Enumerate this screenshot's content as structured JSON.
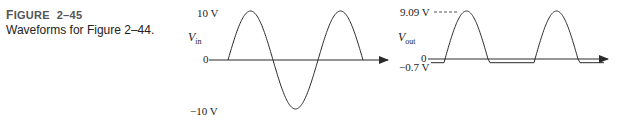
{
  "caption": {
    "figure_label_first": "F",
    "figure_label_rest": "IGURE",
    "figure_number": "2–45",
    "description": "Waveforms for Figure 2–44."
  },
  "input_plot": {
    "signal_symbol": "V",
    "signal_subscript": "in",
    "labels": {
      "positive_peak": "10 V",
      "zero": "0",
      "negative_peak": "−10 V"
    },
    "positive_peak_volts": 10,
    "negative_peak_volts": -10,
    "waveform": "sine",
    "cycles_shown": 1.5
  },
  "output_plot": {
    "signal_symbol": "V",
    "signal_subscript": "out",
    "labels": {
      "positive_peak": "9.09 V",
      "zero": "0",
      "negative_level": "−0.7 V"
    },
    "positive_peak_volts": 9.09,
    "negative_level_volts": -0.7,
    "waveform": "half-wave rectified (clipped at −0.7 V)",
    "pulses_shown": 2
  },
  "colors": {
    "line": "#2a2a2a",
    "text": "#222222",
    "caption_label": "#555555"
  }
}
